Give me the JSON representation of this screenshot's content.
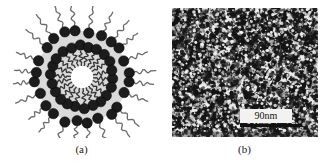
{
  "figure": {
    "background_color": "#ffffff",
    "panels": [
      {
        "id": "panel-a",
        "caption": "(a)",
        "type": "schematic-diagram",
        "description": "Cross-sectional schematic of a surfactant micelle / vesicle",
        "colors": {
          "head_group": "#1c1c1c",
          "tail_chain": "#6b6b6b",
          "bilayer_fill": "#d9d9d9",
          "core": "#ffffff"
        },
        "structure": {
          "center_x": 82,
          "center_y": 77,
          "core_radius": 11,
          "inner_head_ring_radius": 31,
          "outer_head_ring_radius": 46,
          "inner_head_count": 22,
          "outer_head_count": 24,
          "head_radius_inner": 5.2,
          "head_radius_outer": 5.2,
          "tail_stroke_width": 1.3
        }
      },
      {
        "id": "panel-b",
        "caption": "(b)",
        "type": "tem-micrograph",
        "description": "Grayscale transmission electron micrograph showing dense granular nanostructure",
        "scalebar": {
          "label": "90nm",
          "value": 90,
          "unit": "nm",
          "bar_color": "#111111",
          "label_background": "#f2f2f0"
        },
        "image": {
          "width": 146,
          "height": 129,
          "background_color": "#e8e8e8",
          "speckle_color": "#141414",
          "speckle_density": "high"
        }
      }
    ]
  }
}
